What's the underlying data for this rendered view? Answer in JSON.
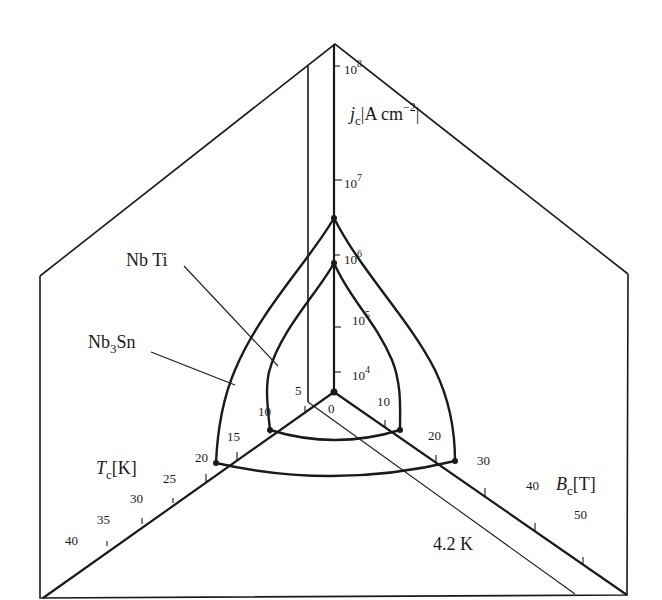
{
  "diagram": {
    "axes": {
      "j": {
        "symbol": "j",
        "subscript": "c",
        "unit_open": "|A cm",
        "unit_exp": "−2",
        "unit_close": "|",
        "ticks": [
          {
            "base": "10",
            "exp": "4"
          },
          {
            "base": "10",
            "exp": "5"
          },
          {
            "base": "10",
            "exp": "6"
          },
          {
            "base": "10",
            "exp": "7"
          },
          {
            "base": "10",
            "exp": "8"
          }
        ]
      },
      "T": {
        "symbol": "T",
        "subscript": "c",
        "unit": "[K]",
        "ticks": [
          "0",
          "5",
          "10",
          "15",
          "20",
          "25",
          "30",
          "35",
          "40"
        ]
      },
      "B": {
        "symbol": "B",
        "subscript": "c",
        "unit": "[T]",
        "ticks": [
          "10",
          "20",
          "30",
          "40",
          "50"
        ]
      }
    },
    "materials": [
      {
        "name": "Nb Ti",
        "label_main": "Nb Ti",
        "Tc": 10,
        "Bc": 15,
        "jc_log10": 6
      },
      {
        "name": "Nb3Sn",
        "label_main": "Nb",
        "label_sub": "3",
        "label_tail": "Sn",
        "Tc": 20,
        "Bc": 30,
        "jc_log10": 6.6
      }
    ],
    "isotherm_label": "4.2 K"
  }
}
